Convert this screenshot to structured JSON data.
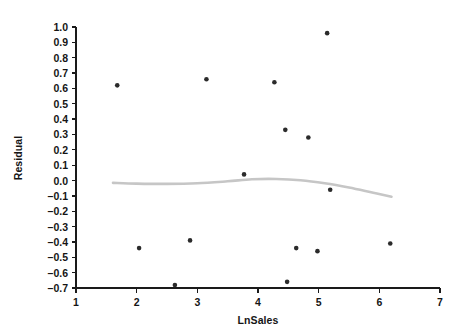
{
  "chart_data": {
    "type": "scatter",
    "title": "",
    "xlabel": "LnSales",
    "ylabel": "Residual",
    "xlim": [
      1,
      7
    ],
    "ylim": [
      -0.7,
      1.0
    ],
    "grid": false,
    "legend": null,
    "x_ticks": [
      "1",
      "2",
      "3",
      "4",
      "5",
      "6",
      "7"
    ],
    "x_tick_values": [
      1,
      2,
      3,
      4,
      5,
      6,
      7
    ],
    "y_ticks": [
      "1.0",
      "0.9",
      "0.8",
      "0.7",
      "0.6",
      "0.5",
      "0.4",
      "0.3",
      "0.2",
      "0.1",
      "0.0",
      "-0.1",
      "-0.2",
      "-0.3",
      "-0.4",
      "-0.5",
      "-0.6",
      "-0.7"
    ],
    "y_tick_values": [
      1.0,
      0.9,
      0.8,
      0.7,
      0.6,
      0.5,
      0.4,
      0.3,
      0.2,
      0.1,
      0.0,
      -0.1,
      -0.2,
      -0.3,
      -0.4,
      -0.5,
      -0.6,
      -0.7
    ],
    "point_color": "#2b2b2b",
    "axis_color": "#1a1a1a",
    "series": [
      {
        "name": "Residuals",
        "type": "scatter",
        "points": [
          {
            "x": 1.68,
            "y": 0.62
          },
          {
            "x": 2.04,
            "y": -0.44
          },
          {
            "x": 2.63,
            "y": -0.68
          },
          {
            "x": 2.88,
            "y": -0.39
          },
          {
            "x": 3.15,
            "y": 0.66
          },
          {
            "x": 3.77,
            "y": 0.04
          },
          {
            "x": 4.27,
            "y": 0.64
          },
          {
            "x": 4.45,
            "y": 0.33
          },
          {
            "x": 4.48,
            "y": -0.66
          },
          {
            "x": 4.63,
            "y": -0.44
          },
          {
            "x": 4.83,
            "y": 0.28
          },
          {
            "x": 4.98,
            "y": -0.46
          },
          {
            "x": 5.14,
            "y": 0.96
          },
          {
            "x": 5.19,
            "y": -0.06
          },
          {
            "x": 6.18,
            "y": -0.41
          }
        ]
      },
      {
        "name": "Smoothing fit",
        "type": "line",
        "color": "#c6c6c6",
        "points": [
          {
            "x": 1.61,
            "y": -0.015
          },
          {
            "x": 2.0,
            "y": -0.02
          },
          {
            "x": 2.5,
            "y": -0.022
          },
          {
            "x": 3.0,
            "y": -0.018
          },
          {
            "x": 3.5,
            "y": -0.005
          },
          {
            "x": 3.9,
            "y": 0.008
          },
          {
            "x": 4.3,
            "y": 0.01
          },
          {
            "x": 4.7,
            "y": 0.002
          },
          {
            "x": 5.1,
            "y": -0.018
          },
          {
            "x": 5.5,
            "y": -0.046
          },
          {
            "x": 5.9,
            "y": -0.08
          },
          {
            "x": 6.2,
            "y": -0.105
          }
        ]
      }
    ]
  }
}
